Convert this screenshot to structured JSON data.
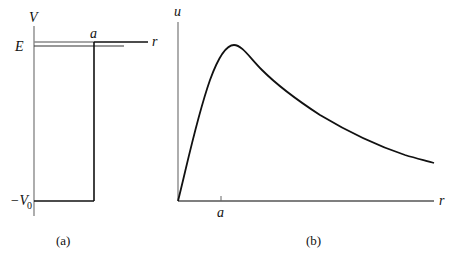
{
  "figure": {
    "panel_a": {
      "caption": "(a)",
      "y_axis_label": "V",
      "x_axis_label": "r",
      "energy_label": "E",
      "well_width_label": "a",
      "well_depth_label": "−V",
      "well_depth_subscript": "0",
      "description": "Finite square well potential V(r) of depth −V0 and width a, with energy level E just below zero"
    },
    "panel_b": {
      "caption": "(b)",
      "y_axis_label": "u",
      "x_axis_label": "r",
      "tick_label": "a",
      "description": "Radial wavefunction u(r): rises from origin to a peak near r = a, then decays exponentially"
    },
    "colors": {
      "line": "#111111",
      "axis_gray": "#888888",
      "background": "#ffffff"
    }
  }
}
